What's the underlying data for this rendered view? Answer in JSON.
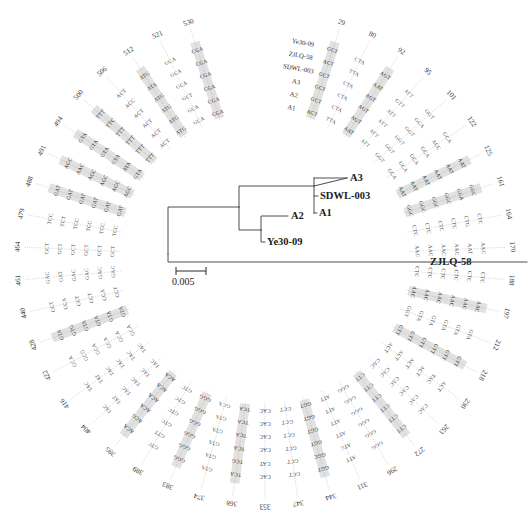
{
  "figure": {
    "type": "circular-codon-alignment-with-phylogenetic-tree",
    "background_color": "#ffffff",
    "text_color": "#2a2a2a",
    "highlight_color": "#d8d8d8"
  },
  "tree": {
    "scale_bar": {
      "label": "0.005",
      "value": 0.005
    },
    "leaves": [
      {
        "name": "A3",
        "label": "A3"
      },
      {
        "name": "SDWL-003",
        "label": "SDWL-003"
      },
      {
        "name": "A1",
        "label": "A1"
      },
      {
        "name": "A2",
        "label": "A2"
      },
      {
        "name": "Ye30-09",
        "label": "Ye30-09"
      },
      {
        "name": "ZJLQ-58",
        "label": "ZJLQ-58"
      }
    ]
  },
  "alignment": {
    "row_labels": [
      "A1",
      "A2",
      "A3",
      "SDWL-003",
      "ZJLQ-58",
      "Ye30-09"
    ],
    "row_count": 6,
    "positions": [
      "29",
      "80",
      "92",
      "95",
      "101",
      "122",
      "125",
      "161",
      "164",
      "170",
      "188",
      "197",
      "212",
      "218",
      "230",
      "263",
      "272",
      "296",
      "311",
      "344",
      "347",
      "353",
      "368",
      "374",
      "383",
      "389",
      "395",
      "404",
      "416",
      "422",
      "428",
      "440",
      "461",
      "464",
      "479",
      "488",
      "491",
      "494",
      "500",
      "506",
      "512",
      "521",
      "530"
    ],
    "columns": [
      {
        "position": "29",
        "codons": [
          "ACT",
          "GCT",
          "GCT",
          "GCT",
          "ACT",
          "GCT"
        ],
        "highlighted": true
      },
      {
        "position": "80",
        "codons": [
          "TTA",
          "CTA",
          "CTA",
          "CTA",
          "TTA",
          "CTA"
        ],
        "highlighted": false
      },
      {
        "position": "92",
        "codons": [
          "AAT",
          "AGT",
          "AGT",
          "AGT",
          "AAT",
          "AGT"
        ],
        "highlighted": true
      },
      {
        "position": "95",
        "codons": [
          "ATT",
          "ATT",
          "ATT",
          "ATT",
          "GTT",
          "ATT"
        ],
        "highlighted": false
      },
      {
        "position": "101",
        "codons": [
          "GGT",
          "GGT",
          "GGT",
          "GGT",
          "GCA",
          "GGT"
        ],
        "highlighted": false
      },
      {
        "position": "122",
        "codons": [
          "GCA",
          "GCA",
          "GCA",
          "GCA",
          "ACC",
          "GCA"
        ],
        "highlighted": false
      },
      {
        "position": "125",
        "codons": [
          "AAT",
          "AAT",
          "AAT",
          "AAT",
          "AAT",
          "AAT"
        ],
        "highlighted": true
      },
      {
        "position": "161",
        "codons": [
          "GGC",
          "GGC",
          "GGC",
          "GGC",
          "GGA",
          "GGC"
        ],
        "highlighted": true
      },
      {
        "position": "164",
        "codons": [
          "CTC",
          "CTC",
          "CTC",
          "CTC",
          "CTG",
          "CTC"
        ],
        "highlighted": false
      },
      {
        "position": "170",
        "codons": [
          "AAC",
          "AAC",
          "AAC",
          "AAC",
          "AAT",
          "AAC"
        ],
        "highlighted": false
      },
      {
        "position": "188",
        "codons": [
          "CTC",
          "CTC",
          "CTC",
          "CTC",
          "CTC",
          "CTC"
        ],
        "highlighted": false
      },
      {
        "position": "197",
        "codons": [
          "AAC",
          "AAC",
          "AAC",
          "AAC",
          "AAC",
          "AAC"
        ],
        "highlighted": true
      },
      {
        "position": "212",
        "codons": [
          "GGT",
          "GTA",
          "GTA",
          "GTA",
          "GTA",
          "GTA"
        ],
        "highlighted": false
      },
      {
        "position": "218",
        "codons": [
          "GTT",
          "GTT",
          "GTT",
          "GTT",
          "GTT",
          "GTT"
        ],
        "highlighted": true
      },
      {
        "position": "230",
        "codons": [
          "ACT",
          "ACT",
          "ACT",
          "ACT",
          "TAC",
          "ACT"
        ],
        "highlighted": false
      },
      {
        "position": "263",
        "codons": [
          "CAC",
          "CAC",
          "CAC",
          "CAC",
          "CAC",
          "CAC"
        ],
        "highlighted": false
      },
      {
        "position": "272",
        "codons": [
          "CTT",
          "CTT",
          "CTT",
          "CTT",
          "CTT",
          "CTT"
        ],
        "highlighted": true
      },
      {
        "position": "296",
        "codons": [
          "GGG",
          "GGG",
          "GGG",
          "GGG",
          "GGG",
          "GGG"
        ],
        "highlighted": false
      },
      {
        "position": "311",
        "codons": [
          "ATT",
          "ATT",
          "ATT",
          "ATT",
          "ATC",
          "ATT"
        ],
        "highlighted": false
      },
      {
        "position": "344",
        "codons": [
          "GGT",
          "GGT",
          "GGT",
          "GGT",
          "GGC",
          "GGT"
        ],
        "highlighted": true
      },
      {
        "position": "347",
        "codons": [
          "GCT",
          "GCT",
          "GCT",
          "GCT",
          "GCT",
          "GCT"
        ],
        "highlighted": false
      },
      {
        "position": "353",
        "codons": [
          "CAC",
          "CAC",
          "CAC",
          "CAC",
          "CAT",
          "CAC"
        ],
        "highlighted": false
      },
      {
        "position": "368",
        "codons": [
          "TCA",
          "TCA",
          "TCA",
          "TCA",
          "TCG",
          "TCA"
        ],
        "highlighted": true
      },
      {
        "position": "374",
        "codons": [
          "GCA",
          "GTA",
          "GTA",
          "GTA",
          "GTA",
          "GTA"
        ],
        "highlighted": false
      },
      {
        "position": "383",
        "codons": [
          "GGG",
          "GGG",
          "GGG",
          "GGG",
          "GGG",
          "GGG"
        ],
        "highlighted": true
      },
      {
        "position": "389",
        "codons": [
          "GTC",
          "GTC",
          "GTC",
          "GTC",
          "GTT",
          "GTC"
        ],
        "highlighted": false
      },
      {
        "position": "395",
        "codons": [
          "ACA",
          "ACA",
          "ACA",
          "ACA",
          "ACG",
          "ACA"
        ],
        "highlighted": true
      },
      {
        "position": "404",
        "codons": [
          "TAC",
          "TAC",
          "TAC",
          "TAC",
          "TAT",
          "TAC"
        ],
        "highlighted": false
      },
      {
        "position": "416",
        "codons": [
          "TAC",
          "TAC",
          "TAC",
          "TAC",
          "TAT",
          "TAC"
        ],
        "highlighted": false
      },
      {
        "position": "422",
        "codons": [
          "GCA",
          "GCA",
          "GCA",
          "GCA",
          "GCG",
          "GCA"
        ],
        "highlighted": false
      },
      {
        "position": "428",
        "codons": [
          "GTA",
          "GTA",
          "GTA",
          "GTA",
          "GTG",
          "GTA"
        ],
        "highlighted": true
      },
      {
        "position": "440",
        "codons": [
          "CCT",
          "CCA",
          "CCT",
          "CCT",
          "CCA",
          "CCT"
        ],
        "highlighted": false
      },
      {
        "position": "461",
        "codons": [
          "GAC",
          "GAC",
          "GAC",
          "GAC",
          "GAT",
          "GAC"
        ],
        "highlighted": false
      },
      {
        "position": "464",
        "codons": [
          "GCT",
          "GCT",
          "GCT",
          "GCT",
          "GCT",
          "GCT"
        ],
        "highlighted": false
      },
      {
        "position": "479",
        "codons": [
          "TCC",
          "TCC",
          "TCC",
          "TCC",
          "TCT",
          "TCC"
        ],
        "highlighted": false
      },
      {
        "position": "488",
        "codons": [
          "GAT",
          "GAT",
          "GAT",
          "GAT",
          "GAT",
          "GAT"
        ],
        "highlighted": true
      },
      {
        "position": "491",
        "codons": [
          "AGC",
          "AGC",
          "AGC",
          "AGC",
          "AAC",
          "AGC"
        ],
        "highlighted": true
      },
      {
        "position": "494",
        "codons": [
          "GTA",
          "ATA",
          "GTA",
          "GTA",
          "GTA",
          "GTA"
        ],
        "highlighted": true
      },
      {
        "position": "500",
        "codons": [
          "TTT",
          "TTT",
          "TTT",
          "TTT",
          "TTC",
          "TTT"
        ],
        "highlighted": true
      },
      {
        "position": "506",
        "codons": [
          "ACT",
          "ACT",
          "ACT",
          "ACT",
          "ACC",
          "ACT"
        ],
        "highlighted": false
      },
      {
        "position": "512",
        "codons": [
          "ATG",
          "ATG",
          "ATG",
          "ATG",
          "ATA",
          "ATG"
        ],
        "highlighted": true
      },
      {
        "position": "521",
        "codons": [
          "GCA",
          "GCA",
          "GCT",
          "GCA",
          "GCA",
          "GCA"
        ],
        "highlighted": false
      },
      {
        "position": "530",
        "codons": [
          "CGA",
          "CGA",
          "CGA",
          "CGA",
          "CGA",
          "CGA"
        ],
        "highlighted": true
      }
    ]
  }
}
